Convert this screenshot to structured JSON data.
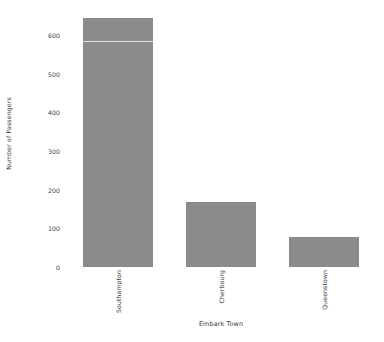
{
  "chart_data": {
    "type": "bar",
    "title": "",
    "xlabel": "Embark Town",
    "ylabel": "Number of Passengers",
    "categories": [
      "Southampton",
      "Cherbourg",
      "Queenstown"
    ],
    "values": [
      644,
      168,
      77
    ],
    "ylim": [
      0,
      660
    ],
    "yticks": [
      0,
      100,
      200,
      300,
      400,
      500,
      600
    ],
    "ytick_labels": [
      "0",
      "100",
      "200",
      "300",
      "400",
      "500",
      "600"
    ],
    "grid": false,
    "legend": null,
    "bar_color": "#8b8b8b",
    "text_color": "#3b3b3b",
    "background": "#ffffff"
  },
  "axes": {
    "y_axis_title": "Number of Passengers",
    "x_axis_title": "Embark Town"
  }
}
